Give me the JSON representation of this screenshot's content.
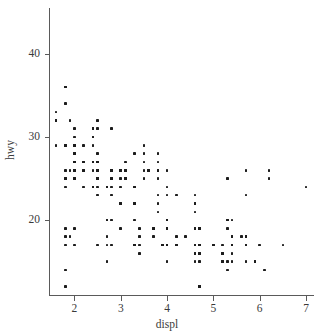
{
  "chart_data": {
    "type": "scatter",
    "title": "",
    "xlabel": "displ",
    "ylabel": "hwy",
    "xlim": [
      1.45,
      7.15
    ],
    "ylim": [
      11.0,
      45.5
    ],
    "xticks": [
      2,
      3,
      4,
      5,
      6,
      7
    ],
    "yticks": [
      20,
      30,
      40
    ],
    "grid": false,
    "legend": "none",
    "point_color": "#1c1c1c",
    "axis_color": "#5a5a5a",
    "background": "#ffffff",
    "n_points": 234,
    "x": [
      1.8,
      1.8,
      2.0,
      2.0,
      2.8,
      2.8,
      3.1,
      1.8,
      1.8,
      2.0,
      2.0,
      2.8,
      2.8,
      3.1,
      3.1,
      2.8,
      3.1,
      4.2,
      5.3,
      5.3,
      5.3,
      5.7,
      6.0,
      5.7,
      5.7,
      6.2,
      6.2,
      7.0,
      5.3,
      5.3,
      5.7,
      6.5,
      2.4,
      2.4,
      3.1,
      3.5,
      3.6,
      2.4,
      3.0,
      3.3,
      3.3,
      3.3,
      3.3,
      3.3,
      3.8,
      3.8,
      3.8,
      4.0,
      3.7,
      3.7,
      3.9,
      3.9,
      4.7,
      4.7,
      4.7,
      5.2,
      5.2,
      3.9,
      4.7,
      4.7,
      4.7,
      5.2,
      5.7,
      5.9,
      4.7,
      4.7,
      4.7,
      4.7,
      4.7,
      4.7,
      5.2,
      5.2,
      5.7,
      5.9,
      4.6,
      5.4,
      5.4,
      4.0,
      4.0,
      4.0,
      4.0,
      4.6,
      5.0,
      4.2,
      4.2,
      4.6,
      4.6,
      4.6,
      5.4,
      5.4,
      3.8,
      3.8,
      4.0,
      4.0,
      4.6,
      4.6,
      4.6,
      4.6,
      5.4,
      1.6,
      1.6,
      1.6,
      1.6,
      1.6,
      1.8,
      1.8,
      1.8,
      2.0,
      2.4,
      2.4,
      2.4,
      2.4,
      2.5,
      2.5,
      3.3,
      2.0,
      2.0,
      2.0,
      2.0,
      2.7,
      2.7,
      2.7,
      3.0,
      3.7,
      4.0,
      4.7,
      4.7,
      4.7,
      5.7,
      6.1,
      4.0,
      4.2,
      4.4,
      4.6,
      5.4,
      5.4,
      5.4,
      4.0,
      4.0,
      4.6,
      5.0,
      2.4,
      2.4,
      2.5,
      2.5,
      3.5,
      3.5,
      3.0,
      3.0,
      3.5,
      3.3,
      3.3,
      4.0,
      5.6,
      3.1,
      3.8,
      3.8,
      3.8,
      5.3,
      2.5,
      2.5,
      2.5,
      2.5,
      2.5,
      2.5,
      2.2,
      2.2,
      2.5,
      2.5,
      2.5,
      2.5,
      2.5,
      2.5,
      2.7,
      2.7,
      3.4,
      3.4,
      4.0,
      4.7,
      2.2,
      2.2,
      2.4,
      2.4,
      3.0,
      3.0,
      3.5,
      2.2,
      2.2,
      2.4,
      2.4,
      3.0,
      3.0,
      3.3,
      1.8,
      1.8,
      1.8,
      1.8,
      1.8,
      4.7,
      5.7,
      2.7,
      2.7,
      2.7,
      3.4,
      3.4,
      4.0,
      4.0,
      2.0,
      2.0,
      2.0,
      2.0,
      2.8,
      1.9,
      2.0,
      2.0,
      2.0,
      2.0,
      2.5,
      2.5,
      2.8,
      2.8,
      1.9,
      1.9,
      2.0,
      2.0,
      2.5,
      2.5,
      1.8,
      1.8,
      2.0,
      2.0,
      2.8,
      2.8,
      3.6
    ],
    "y": [
      29,
      29,
      31,
      30,
      26,
      26,
      27,
      26,
      25,
      28,
      27,
      25,
      25,
      25,
      25,
      24,
      25,
      23,
      20,
      15,
      20,
      17,
      17,
      26,
      23,
      26,
      25,
      24,
      19,
      14,
      15,
      17,
      27,
      30,
      26,
      29,
      26,
      24,
      24,
      22,
      22,
      24,
      24,
      17,
      22,
      21,
      23,
      23,
      19,
      18,
      17,
      17,
      19,
      19,
      12,
      17,
      15,
      17,
      17,
      12,
      17,
      16,
      18,
      15,
      16,
      12,
      17,
      17,
      16,
      12,
      15,
      16,
      17,
      15,
      17,
      17,
      18,
      17,
      19,
      17,
      19,
      19,
      17,
      17,
      17,
      16,
      16,
      17,
      15,
      17,
      26,
      25,
      26,
      24,
      21,
      22,
      23,
      22,
      20,
      33,
      32,
      32,
      29,
      32,
      34,
      36,
      36,
      29,
      26,
      27,
      30,
      31,
      26,
      26,
      28,
      26,
      29,
      28,
      27,
      24,
      24,
      24,
      22,
      19,
      20,
      17,
      12,
      19,
      18,
      14,
      15,
      18,
      18,
      15,
      17,
      16,
      18,
      17,
      19,
      19,
      17,
      29,
      27,
      31,
      32,
      27,
      26,
      26,
      25,
      25,
      17,
      17,
      20,
      18,
      26,
      26,
      27,
      28,
      25,
      25,
      24,
      27,
      25,
      26,
      23,
      26,
      26,
      26,
      26,
      25,
      27,
      25,
      27,
      20,
      20,
      19,
      17,
      20,
      17,
      29,
      27,
      31,
      31,
      26,
      26,
      28,
      27,
      24,
      24,
      24,
      22,
      19,
      20,
      17,
      12,
      19,
      18,
      14,
      15,
      18,
      18,
      15,
      17,
      16,
      18,
      17,
      19,
      19,
      17,
      29,
      27,
      31,
      32,
      27,
      26,
      26,
      25,
      25,
      17,
      17,
      20,
      18,
      26,
      26,
      27,
      28,
      25,
      25,
      24,
      27,
      25,
      26,
      23,
      26,
      26
    ]
  },
  "axis": {
    "x_tick_labels": [
      "2",
      "3",
      "4",
      "5",
      "6",
      "7"
    ],
    "y_tick_labels": [
      "20",
      "30",
      "40"
    ],
    "x_title": "displ",
    "y_title": "hwy"
  }
}
